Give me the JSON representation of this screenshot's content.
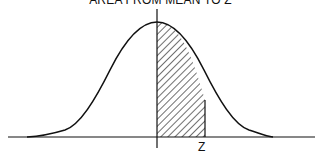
{
  "diagram": {
    "title": "AREA FROM MEAN TO Z",
    "z_label": "Z",
    "colors": {
      "stroke": "#111111",
      "background": "#ffffff"
    }
  }
}
